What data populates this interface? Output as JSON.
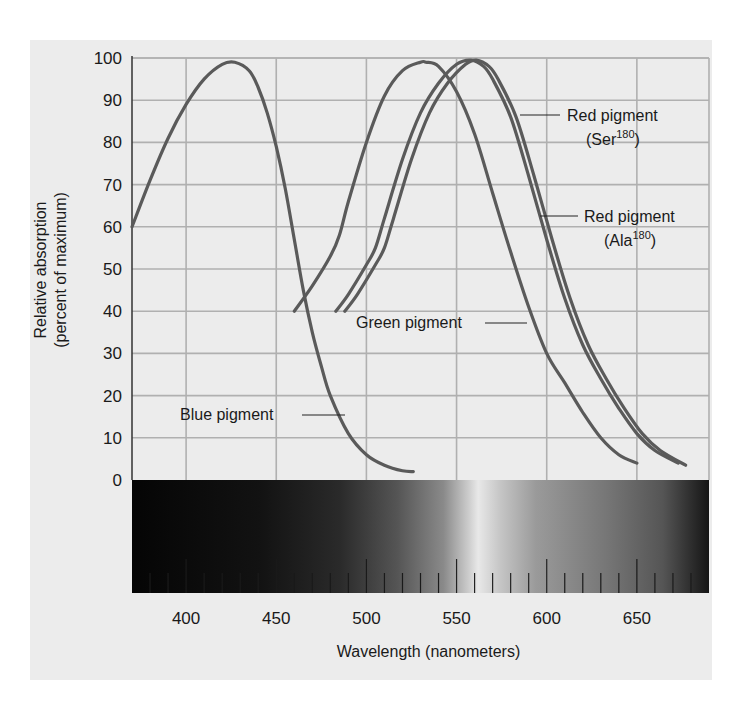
{
  "chart_data": {
    "type": "line",
    "title": "",
    "xlabel": "Wavelength (nanometers)",
    "ylabel": "Relative absorption (percent of maximum)",
    "ylabel_lines": [
      "Relative absorption",
      "(percent of maximum)"
    ],
    "xlim": [
      370,
      690
    ],
    "ylim": [
      0,
      100
    ],
    "grid": true,
    "x_ticks": [
      400,
      450,
      500,
      550,
      600,
      650
    ],
    "y_ticks": [
      0,
      10,
      20,
      30,
      40,
      50,
      60,
      70,
      80,
      90,
      100
    ],
    "spectrum_bar": {
      "description": "grayscale visible-spectrum band below plot with minor ticks every 10 nm, major every 50 nm",
      "minor_tick_step_nm": 10,
      "major_tick_step_nm": 50
    },
    "series": [
      {
        "name": "Blue pigment",
        "label": "Blue pigment",
        "peak_nm": 427,
        "x": [
          370,
          380,
          390,
          400,
          410,
          420,
          427,
          435,
          440,
          445,
          450,
          455,
          460,
          465,
          470,
          475,
          480,
          490,
          500,
          510,
          520,
          526
        ],
        "y": [
          60,
          71,
          81,
          89,
          95,
          98.5,
          99,
          97,
          93,
          87,
          79,
          69,
          57,
          45,
          35,
          27,
          20,
          11,
          6,
          3.5,
          2.2,
          2
        ]
      },
      {
        "name": "Green pigment",
        "label": "Green pigment",
        "peak_nm": 533,
        "x": [
          460,
          470,
          480,
          485,
          490,
          500,
          510,
          520,
          530,
          533,
          540,
          550,
          560,
          570,
          580,
          590,
          600,
          610,
          620,
          630,
          640,
          650
        ],
        "y": [
          40,
          46,
          53,
          58,
          66,
          80,
          91,
          97,
          99,
          99,
          98,
          92,
          82,
          68,
          54,
          41,
          30,
          23,
          16,
          10,
          6,
          4
        ]
      },
      {
        "name": "Red pigment (Ser180)",
        "label": "Red pigment",
        "label_sub": "(Ser",
        "label_sup": "180",
        "label_close": ")",
        "peak_nm": 558,
        "x": [
          483,
          490,
          500,
          505,
          510,
          520,
          530,
          540,
          550,
          558,
          565,
          570,
          580,
          590,
          600,
          610,
          620,
          630,
          640,
          650,
          660,
          673
        ],
        "y": [
          40,
          44,
          51,
          55,
          62,
          76,
          87,
          94,
          98.5,
          99.5,
          98,
          95,
          86,
          72,
          57,
          43,
          32,
          24,
          17,
          11,
          7,
          4
        ]
      },
      {
        "name": "Red pigment (Ala180)",
        "label": "Red pigment",
        "label_sub": "(Ala",
        "label_sup": "180",
        "label_close": ")",
        "peak_nm": 561,
        "x": [
          488,
          495,
          505,
          510,
          515,
          525,
          535,
          545,
          555,
          561,
          568,
          573,
          583,
          593,
          603,
          613,
          623,
          633,
          643,
          653,
          663,
          677
        ],
        "y": [
          40,
          44,
          51,
          55,
          62,
          76,
          87,
          94,
          98.5,
          99.5,
          98,
          95,
          86,
          72,
          57,
          43,
          32,
          24,
          17,
          11,
          7,
          3.5
        ]
      }
    ],
    "annotations": [
      {
        "text": "Blue pigment",
        "points_to": "Blue pigment",
        "at_nm": 480,
        "at_y": 13
      },
      {
        "text": "Green pigment",
        "points_to": "Green pigment",
        "at_nm": 590,
        "at_y": 37
      },
      {
        "text": "Red pigment (Ser180)",
        "points_to": "Red pigment (Ser180)",
        "at_nm": 585,
        "at_y": 87
      },
      {
        "text": "Red pigment (Ala180)",
        "points_to": "Red pigment (Ala180)",
        "at_nm": 597,
        "at_y": 63
      }
    ],
    "colors": {
      "curve": "#5a5a5a",
      "grid": "#b0b0b0",
      "panel_bg": "#ececec",
      "text": "#1a1a1a"
    }
  }
}
